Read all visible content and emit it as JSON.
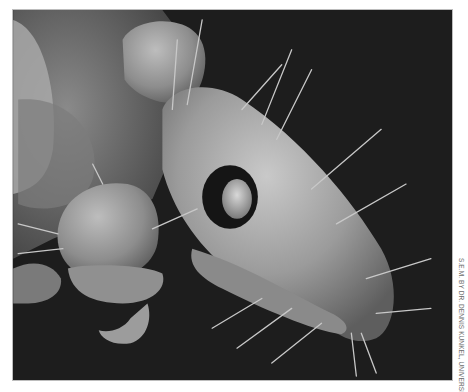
{
  "image": {
    "subject": "scanning electron micrograph of an insect head (grayscale)",
    "colors": {
      "background": "#ffffff",
      "specimen_background": "#1c1c1c",
      "specimen_surface": "#9a9a9a",
      "credit_text": "#6b6b6b"
    }
  },
  "credit": {
    "text": "S.E.M. BY DR. DENNIS KUNKEL, UNIVERSITY OF HAWAII",
    "orientation": "vertical, rotated 90° clockwise"
  }
}
